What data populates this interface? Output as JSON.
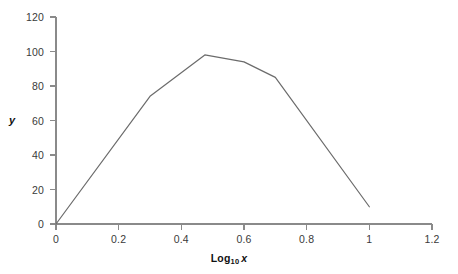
{
  "chart_data": {
    "type": "line",
    "title": "",
    "subtitle": "",
    "xlabel": "Log10 x",
    "xlabel_base": "Log",
    "xlabel_sub": "10",
    "xlabel_var": "x",
    "ylabel": "y",
    "xlim": [
      0,
      1.2
    ],
    "ylim": [
      0,
      120
    ],
    "xticks": [
      0,
      0.2,
      0.4,
      0.6,
      0.8,
      1,
      1.2
    ],
    "xtick_labels": [
      "0",
      "0.2",
      "0.4",
      "0.6",
      "0.8",
      "1",
      "1.2"
    ],
    "yticks": [
      0,
      20,
      40,
      60,
      80,
      100,
      120
    ],
    "ytick_labels": [
      "0",
      "20",
      "40",
      "60",
      "80",
      "100",
      "120"
    ],
    "grid": false,
    "legend": false,
    "legend_position": "none",
    "markers": false,
    "x": [
      0,
      0.3,
      0.475,
      0.6,
      0.7,
      1.0
    ],
    "y": [
      0,
      74,
      98,
      94,
      85,
      10
    ],
    "series": [
      {
        "name": "y",
        "color": "#6b6b6b",
        "line_width": 1.2,
        "points": [
          {
            "x": 0,
            "y": 0
          },
          {
            "x": 0.3,
            "y": 74
          },
          {
            "x": 0.475,
            "y": 98
          },
          {
            "x": 0.6,
            "y": 94
          },
          {
            "x": 0.7,
            "y": 85
          },
          {
            "x": 1.0,
            "y": 10
          }
        ]
      }
    ],
    "annotations": [],
    "colors": {
      "background": "#ffffff",
      "line": "#6b6b6b",
      "axis": "#8a8a8a",
      "tick_text": "#3a3a3a",
      "title_text": "#111111"
    }
  }
}
